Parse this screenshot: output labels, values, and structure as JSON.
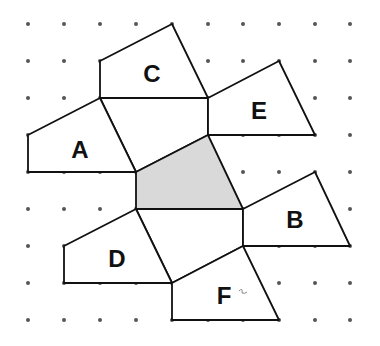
{
  "diagram": {
    "title": "",
    "grid": {
      "x_positions": [
        28,
        64,
        100,
        136,
        172,
        208,
        243,
        279,
        315,
        350
      ],
      "y_positions": [
        24,
        61,
        98,
        135,
        172,
        209,
        246,
        283,
        320
      ],
      "dot_color": "#555555"
    },
    "shaded_shape": {
      "name": "center-shaded-quadrilateral",
      "points": "136,172 208,135 243,209 136,209",
      "fill": "#d9d9d9"
    },
    "connector_shapes": [
      {
        "name": "upper-middle-quadrilateral",
        "points": "100,98 208,98 208,135 136,172"
      },
      {
        "name": "lower-middle-quadrilateral",
        "points": "136,209 243,209 243,246 172,283"
      }
    ],
    "labeled_shapes": [
      {
        "label": "A",
        "points": "28,135 100,98 136,172 28,172",
        "label_x": 80,
        "label_y": 149
      },
      {
        "label": "B",
        "points": "243,209 315,172 350,246 243,246",
        "label_x": 295,
        "label_y": 219
      },
      {
        "label": "C",
        "points": "100,61 172,24 208,98 100,98",
        "label_x": 152,
        "label_y": 73
      },
      {
        "label": "D",
        "points": "64,246 136,209 172,283 64,283",
        "label_x": 117,
        "label_y": 258
      },
      {
        "label": "E",
        "points": "208,98 279,61 315,135 208,135",
        "label_x": 259,
        "label_y": 110
      },
      {
        "label": "F",
        "points": "172,283 243,246 279,320 172,320",
        "label_x": 224,
        "label_y": 295
      }
    ]
  }
}
